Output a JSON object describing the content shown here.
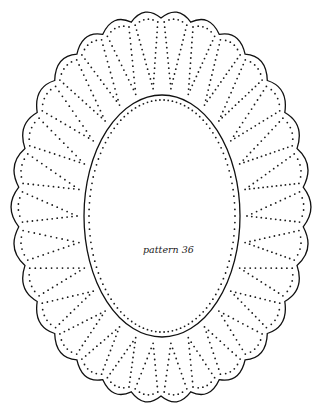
{
  "figure": {
    "label": "pattern 36",
    "stroke_color": "#111111",
    "dot_color": "#1a1a1a",
    "background": "#ffffff",
    "outer": {
      "cx": 161,
      "cy": 207,
      "rx": 150,
      "ry": 196,
      "scallops": 30,
      "scallop_depth": 7
    },
    "inner": {
      "cx": 162,
      "cy": 216,
      "rx": 78,
      "ry": 121
    },
    "petals": {
      "count": 30,
      "dot_spacing": 5.2
    }
  }
}
